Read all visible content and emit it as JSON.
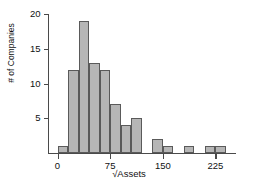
{
  "chart_data": {
    "type": "bar",
    "title": "",
    "subtitle": "",
    "xlabel": "√Assets",
    "ylabel": "# of Companies",
    "grid": false,
    "legend": null,
    "xlim": [
      -8,
      248
    ],
    "ylim": [
      0,
      21
    ],
    "xticks": [
      0,
      75,
      150,
      225
    ],
    "xtick_labels": [
      "0",
      "75",
      "150",
      "225"
    ],
    "yticks": [
      5,
      10,
      15,
      20
    ],
    "ytick_labels": [
      "5",
      "10",
      "15",
      "20"
    ],
    "bin_width": 15,
    "bin_starts": [
      0,
      15,
      30,
      45,
      60,
      75,
      90,
      105,
      120,
      135,
      150,
      165,
      180,
      195,
      210,
      225
    ],
    "categories": [
      "0-15",
      "15-30",
      "30-45",
      "45-60",
      "60-75",
      "75-90",
      "90-105",
      "105-120",
      "120-135",
      "135-150",
      "150-165",
      "165-180",
      "180-195",
      "195-210",
      "210-225",
      "225-240"
    ],
    "values": [
      1,
      12,
      19,
      13,
      12,
      7,
      4,
      5,
      0,
      2,
      1,
      0,
      1,
      0,
      1,
      1
    ],
    "bar_fill_color": "#b6b6b6",
    "bar_edge_color": "#5a5a5a",
    "axis_color": "#4a4a4a",
    "background_color": "#ffffff"
  }
}
